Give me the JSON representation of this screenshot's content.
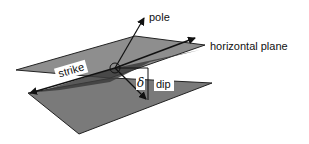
{
  "diagram": {
    "labels": {
      "pole": "pole",
      "horizontal_plane": "horizontal plane",
      "strike": "strike",
      "dip": "dip",
      "dip_angle_symbol": "δ"
    },
    "colors": {
      "background": "#ffffff",
      "dipping_plane": "#7a7a7a",
      "horizontal_plane": "#8e8e8e",
      "shadow": "#3c3c3c",
      "lines": "#111111",
      "label_box": "#ffffff"
    },
    "elements": [
      {
        "name": "horizontal-plane",
        "type": "parallelogram"
      },
      {
        "name": "dipping-plane",
        "type": "parallelogram"
      },
      {
        "name": "strike-line",
        "type": "arrow",
        "direction": "both"
      },
      {
        "name": "pole-vector",
        "type": "arrow"
      },
      {
        "name": "dip-vector",
        "type": "arrow"
      },
      {
        "name": "right-angle-marker",
        "type": "arc"
      }
    ]
  }
}
